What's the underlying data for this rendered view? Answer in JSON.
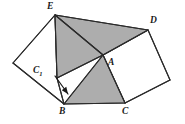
{
  "figure": {
    "canvas": {
      "width": 185,
      "height": 124
    },
    "colors": {
      "background": "#ffffff",
      "shaded_fill": "#adadad",
      "unshaded_fill": "#ffffff",
      "stroke": "#2b2b2b",
      "label_color": "#1a1a1a"
    },
    "points": {
      "E": {
        "x": 55,
        "y": 15,
        "label": "E"
      },
      "D": {
        "x": 148,
        "y": 30,
        "label": "D"
      },
      "A": {
        "x": 103,
        "y": 55,
        "label": "A"
      },
      "C1": {
        "x": 57,
        "y": 78,
        "label": "C",
        "sub": "1"
      },
      "B": {
        "x": 64,
        "y": 104,
        "label": "B"
      },
      "C": {
        "x": 125,
        "y": 103,
        "label": "C"
      },
      "L": {
        "x": 13,
        "y": 63,
        "label": ""
      },
      "R": {
        "x": 170,
        "y": 80,
        "label": ""
      }
    },
    "labels": [
      {
        "name": "label-E",
        "text": "E",
        "sub": "",
        "x": 47,
        "y": 2,
        "point": "E"
      },
      {
        "name": "label-D",
        "text": "D",
        "sub": "",
        "x": 150,
        "y": 16,
        "point": "D"
      },
      {
        "name": "label-A",
        "text": "A",
        "sub": "",
        "x": 108,
        "y": 58,
        "point": "A"
      },
      {
        "name": "label-C1",
        "text": "C",
        "sub": "1",
        "x": 33,
        "y": 66,
        "point": "C1"
      },
      {
        "name": "label-B",
        "text": "B",
        "sub": "",
        "x": 59,
        "y": 107,
        "point": "B"
      },
      {
        "name": "label-C",
        "text": "C",
        "sub": "",
        "x": 122,
        "y": 107,
        "point": "C"
      }
    ],
    "polygons": [
      {
        "name": "square-on-AB-left",
        "vertices": "E,L,B,C1",
        "points": "55,15 13,63 64,104 57,78",
        "fill": "unshaded_fill"
      },
      {
        "name": "square-on-AC-right",
        "vertices": "D,R,C,A",
        "points": "148,30 170,80 125,103 103,55",
        "fill": "unshaded_fill"
      },
      {
        "name": "shaded-triangle-EAD",
        "vertices": "E,A,D",
        "points": "55,15 103,55 148,30",
        "fill": "shaded_fill"
      },
      {
        "name": "shaded-triangle-EC1A",
        "vertices": "E,C1,A",
        "points": "55,15 57,78 103,55",
        "fill": "shaded_fill"
      },
      {
        "name": "shaded-triangle-ABC",
        "vertices": "A,B,C",
        "points": "103,55 64,104 125,103",
        "fill": "shaded_fill"
      }
    ],
    "segments": [
      {
        "name": "segment-E-L",
        "x1": 55,
        "y1": 15,
        "x2": 13,
        "y2": 63
      },
      {
        "name": "segment-L-B",
        "x1": 13,
        "y1": 63,
        "x2": 64,
        "y2": 104
      },
      {
        "name": "segment-B-C1",
        "x1": 64,
        "y1": 104,
        "x2": 57,
        "y2": 78
      },
      {
        "name": "segment-C1-E",
        "x1": 57,
        "y1": 78,
        "x2": 55,
        "y2": 15
      },
      {
        "name": "segment-E-A",
        "x1": 55,
        "y1": 15,
        "x2": 103,
        "y2": 55
      },
      {
        "name": "segment-E-D",
        "x1": 55,
        "y1": 15,
        "x2": 148,
        "y2": 30
      },
      {
        "name": "segment-A-D",
        "x1": 103,
        "y1": 55,
        "x2": 148,
        "y2": 30
      },
      {
        "name": "segment-C1-A",
        "x1": 57,
        "y1": 78,
        "x2": 103,
        "y2": 55
      },
      {
        "name": "segment-A-B",
        "x1": 103,
        "y1": 55,
        "x2": 64,
        "y2": 104
      },
      {
        "name": "segment-A-C",
        "x1": 103,
        "y1": 55,
        "x2": 125,
        "y2": 103
      },
      {
        "name": "segment-B-C",
        "x1": 64,
        "y1": 104,
        "x2": 125,
        "y2": 103
      },
      {
        "name": "segment-D-R",
        "x1": 148,
        "y1": 30,
        "x2": 170,
        "y2": 80
      },
      {
        "name": "segment-R-C",
        "x1": 170,
        "y1": 80,
        "x2": 125,
        "y2": 103
      }
    ],
    "arrow": {
      "name": "pointer-arrow-to-C1-vertex",
      "x1": 55,
      "y1": 76,
      "x2": 68,
      "y2": 94,
      "head_size": 4
    }
  }
}
